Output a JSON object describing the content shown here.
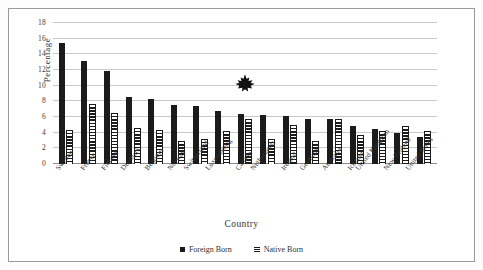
{
  "chart_data": {
    "type": "bar",
    "title": "",
    "xlabel": "Country",
    "ylabel": "Percentage",
    "ylim": [
      0,
      18
    ],
    "yticks": [
      0,
      2,
      4,
      6,
      8,
      10,
      12,
      14,
      16,
      18
    ],
    "grid": true,
    "legend_position": "bottom",
    "categories": [
      "Sweden",
      "France",
      "Finland",
      "Denmark",
      "Belgium",
      "Norway",
      "Switzerland",
      "Luxembourg",
      "Canada",
      "Netherlands",
      "Ireland",
      "Germany",
      "Australia",
      "Iceland",
      "United Kingdom",
      "New Zealand",
      "United States"
    ],
    "series": [
      {
        "name": "Foreign Born",
        "style": "solid-black",
        "values": [
          15.4,
          13.1,
          11.9,
          8.5,
          8.3,
          7.5,
          7.4,
          6.8,
          6.4,
          6.2,
          6.1,
          5.8,
          5.7,
          4.9,
          4.5,
          3.9,
          3.4
        ]
      },
      {
        "name": "Native Born",
        "style": "horizontal-hatch",
        "values": [
          4.3,
          7.6,
          6.5,
          4.6,
          4.3,
          2.9,
          3.2,
          4.2,
          5.8,
          3.2,
          5.0,
          2.9,
          5.7,
          3.7,
          4.2,
          4.8,
          4.2
        ]
      }
    ],
    "annotations": [
      {
        "name": "maple-leaf-marker",
        "icon": "maple-leaf-icon",
        "category": "Canada",
        "value": 8.8,
        "color": "#111111"
      }
    ],
    "colors": {
      "foreign_born": "#1b1b1b",
      "native_born": "#1b1b1b",
      "gridline": "#c9c9c9",
      "axis": "#8e8e8e",
      "background": "#ffffff"
    }
  }
}
